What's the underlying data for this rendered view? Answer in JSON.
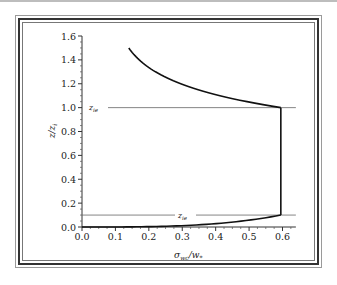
{
  "chart_data": {
    "type": "line",
    "title": "",
    "xlabel": "σ_wc/w_*",
    "ylabel": "z/z_i",
    "xlim": [
      0.0,
      0.64
    ],
    "ylim": [
      0.0,
      1.6
    ],
    "xticks": [
      "0.0",
      "0.1",
      "0.2",
      "0.3",
      "0.4",
      "0.5",
      "0.6"
    ],
    "yticks": [
      "0.0",
      "0.2",
      "0.4",
      "0.6",
      "0.8",
      "1.0",
      "1.2",
      "1.4",
      "1.6"
    ],
    "grid": false,
    "legend": null,
    "series": [
      {
        "name": "profile",
        "x": [
          0.0,
          0.1,
          0.2,
          0.3,
          0.4,
          0.5,
          0.56,
          0.595,
          0.595,
          0.55,
          0.45,
          0.35,
          0.25,
          0.14
        ],
        "y": [
          0.0,
          0.0005,
          0.003,
          0.01,
          0.025,
          0.05,
          0.075,
          0.1,
          1.0,
          1.04,
          1.12,
          1.22,
          1.34,
          1.5
        ]
      }
    ],
    "annotations": [
      {
        "text": "z_ie",
        "y": 1.0,
        "type": "hline"
      },
      {
        "text": "z_ie",
        "y": 0.1,
        "type": "hline"
      }
    ]
  },
  "labels": {
    "xlabel_main": "σ",
    "xlabel_sub": "wc",
    "xlabel_rest": "/w",
    "xlabel_sub2": "*",
    "ylabel": "z/z",
    "ylabel_sub": "i",
    "ann_top": "z",
    "ann_top_sub": "ie",
    "ann_bottom": "z",
    "ann_bottom_sub": "ie"
  }
}
